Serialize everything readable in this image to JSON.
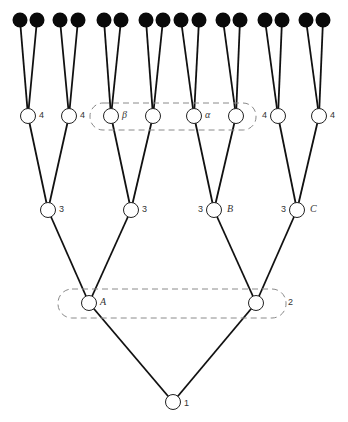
{
  "diagram": {
    "type": "binary-tree",
    "root": {
      "level_label": "1",
      "children": [
        {
          "letter": "A",
          "level_label": "",
          "children": [
            {
              "level_label": "3",
              "letter": "",
              "children": [
                {
                  "level_label": "4",
                  "letter": ""
                },
                {
                  "level_label": "4",
                  "letter": ""
                }
              ]
            },
            {
              "level_label": "3",
              "letter": "",
              "children": [
                {
                  "level_label": "",
                  "letter": "β"
                },
                {
                  "level_label": "",
                  "letter": ""
                }
              ]
            }
          ]
        },
        {
          "letter": "",
          "level_label": "2",
          "children": [
            {
              "level_label": "3",
              "letter": "B",
              "children": [
                {
                  "level_label": "",
                  "letter": "α"
                },
                {
                  "level_label": "",
                  "letter": ""
                }
              ]
            },
            {
              "level_label": "3",
              "letter": "C",
              "children": [
                {
                  "level_label": "4",
                  "letter": ""
                },
                {
                  "level_label": "4",
                  "letter": ""
                }
              ]
            }
          ]
        }
      ]
    },
    "leaf_count": 16,
    "groupings": [
      {
        "name": "level-4 group",
        "members": [
          "β",
          "",
          "α",
          ""
        ]
      },
      {
        "name": "level-2 group",
        "members": [
          "A",
          ""
        ],
        "label": "2"
      }
    ]
  }
}
